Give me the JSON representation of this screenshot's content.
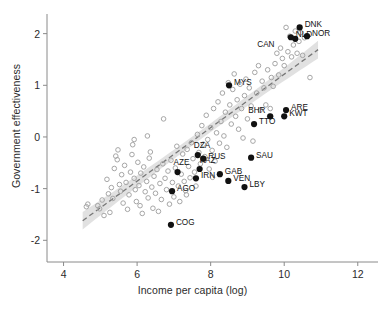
{
  "chart_data": {
    "type": "scatter",
    "title": "",
    "xlabel": "Income per capita (log)",
    "ylabel": "Government effectiveness",
    "xlim": [
      3.55,
      12.55
    ],
    "ylim": [
      -2.42,
      2.38
    ],
    "xticks": [
      4,
      6,
      8,
      10,
      12
    ],
    "xtick_labels": [
      "4",
      "6",
      "8",
      "10",
      "12"
    ],
    "yticks": [
      2,
      1,
      0,
      -1,
      -2
    ],
    "ytick_labels": [
      "2",
      "1",
      "0",
      "-1",
      "-2"
    ],
    "grid": false,
    "legend": "none",
    "fit_line": {
      "style": "dashed",
      "color": "#777777",
      "x_start": 4.52,
      "x_end": 10.92,
      "y_start": -1.62,
      "y_end": 1.69,
      "band": "95% confidence interval",
      "band_color": "#cfcfcf"
    },
    "series": [
      {
        "name": "other countries",
        "marker": "open-circle",
        "color": "#a6a6a6",
        "points": [
          [
            4.62,
            -1.35
          ],
          [
            4.66,
            -1.3
          ],
          [
            4.93,
            -1.33
          ],
          [
            4.98,
            -1.39
          ],
          [
            5.05,
            -1.22
          ],
          [
            5.1,
            -1.52
          ],
          [
            5.18,
            -0.82
          ],
          [
            5.22,
            -1.1
          ],
          [
            5.26,
            -1.46
          ],
          [
            5.3,
            -0.98
          ],
          [
            5.34,
            -1.19
          ],
          [
            5.38,
            -0.61
          ],
          [
            5.42,
            -0.37
          ],
          [
            5.46,
            -0.44
          ],
          [
            5.48,
            -0.25
          ],
          [
            5.52,
            -0.92
          ],
          [
            5.55,
            -1.05
          ],
          [
            5.58,
            -0.73
          ],
          [
            5.62,
            -1.28
          ],
          [
            5.66,
            -0.55
          ],
          [
            5.7,
            -0.88
          ],
          [
            5.74,
            -1.4
          ],
          [
            5.78,
            -1.12
          ],
          [
            5.82,
            -0.68
          ],
          [
            5.86,
            -0.34
          ],
          [
            5.88,
            -0.15
          ],
          [
            5.92,
            -0.8
          ],
          [
            5.95,
            -1.02
          ],
          [
            5.98,
            -1.25
          ],
          [
            6.02,
            -0.49
          ],
          [
            6.05,
            -0.94
          ],
          [
            6.08,
            -1.33
          ],
          [
            6.1,
            -0.7
          ],
          [
            6.14,
            -1.48
          ],
          [
            6.18,
            -0.58
          ],
          [
            6.22,
            -1.06
          ],
          [
            6.26,
            -0.86
          ],
          [
            6.3,
            -1.18
          ],
          [
            6.33,
            -0.41
          ],
          [
            6.36,
            -0.29
          ],
          [
            6.4,
            -0.97
          ],
          [
            6.43,
            -1.38
          ],
          [
            6.46,
            -0.76
          ],
          [
            6.5,
            -1.09
          ],
          [
            6.54,
            -0.63
          ],
          [
            6.58,
            -1.44
          ],
          [
            6.62,
            -0.9
          ],
          [
            6.66,
            -1.21
          ],
          [
            6.7,
            -0.52
          ],
          [
            6.72,
            0.35
          ],
          [
            6.76,
            -0.8
          ],
          [
            6.8,
            -1.02
          ],
          [
            6.84,
            -0.66
          ],
          [
            6.88,
            -1.3
          ],
          [
            6.92,
            -0.45
          ],
          [
            6.96,
            -0.88
          ],
          [
            7.0,
            -1.16
          ],
          [
            7.04,
            -0.6
          ],
          [
            7.08,
            -0.18
          ],
          [
            7.12,
            -0.95
          ],
          [
            7.16,
            -1.25
          ],
          [
            7.2,
            -0.72
          ],
          [
            7.24,
            -0.33
          ],
          [
            7.28,
            -0.86
          ],
          [
            7.32,
            -1.04
          ],
          [
            7.36,
            -0.24
          ],
          [
            7.4,
            -0.57
          ],
          [
            7.44,
            -0.79
          ],
          [
            7.48,
            -0.11
          ],
          [
            7.52,
            -0.42
          ],
          [
            7.56,
            -0.68
          ],
          [
            7.6,
            -0.95
          ],
          [
            7.64,
            0.05
          ],
          [
            7.68,
            -0.3
          ],
          [
            7.72,
            -0.52
          ],
          [
            7.76,
            0.22
          ],
          [
            7.8,
            -0.14
          ],
          [
            7.84,
            -0.38
          ],
          [
            7.88,
            0.42
          ],
          [
            7.92,
            -0.05
          ],
          [
            7.96,
            -0.62
          ],
          [
            8.0,
            0.18
          ],
          [
            8.04,
            -0.26
          ],
          [
            8.08,
            0.55
          ],
          [
            8.12,
            -0.47
          ],
          [
            8.16,
            0.08
          ],
          [
            8.2,
            0.68
          ],
          [
            8.24,
            -0.12
          ],
          [
            8.28,
            0.3
          ],
          [
            8.32,
            0.85
          ],
          [
            8.36,
            0.02
          ],
          [
            8.4,
            0.48
          ],
          [
            8.44,
            -0.2
          ],
          [
            8.48,
            1.05
          ],
          [
            8.52,
            0.62
          ],
          [
            8.56,
            0.25
          ],
          [
            8.6,
            0.92
          ],
          [
            8.64,
            1.22
          ],
          [
            8.68,
            0.4
          ],
          [
            8.72,
            0.72
          ],
          [
            8.76,
            0.15
          ],
          [
            8.8,
            1.02
          ],
          [
            8.84,
            0.55
          ],
          [
            8.88,
            -0.02
          ],
          [
            8.92,
            0.8
          ],
          [
            8.96,
            1.12
          ],
          [
            9.0,
            0.35
          ],
          [
            9.05,
            0.95
          ],
          [
            9.1,
            0.6
          ],
          [
            9.15,
            -0.08
          ],
          [
            9.2,
            1.25
          ],
          [
            9.25,
            0.85
          ],
          [
            9.3,
            1.38
          ],
          [
            9.35,
            0.52
          ],
          [
            9.4,
            1.08
          ],
          [
            9.45,
            0.95
          ],
          [
            9.5,
            0.62
          ],
          [
            9.55,
            1.3
          ],
          [
            9.6,
            0.4
          ],
          [
            9.65,
            1.15
          ],
          [
            9.7,
            0.98
          ],
          [
            9.75,
            1.42
          ],
          [
            9.8,
            1.62
          ],
          [
            9.85,
            1.2
          ],
          [
            9.9,
            1.72
          ],
          [
            9.95,
            1.52
          ],
          [
            10.0,
            1.38
          ],
          [
            10.05,
            2.12
          ],
          [
            10.1,
            1.65
          ],
          [
            10.15,
            1.95
          ],
          [
            10.2,
            1.55
          ],
          [
            10.25,
            1.78
          ],
          [
            10.3,
            2.05
          ],
          [
            10.35,
            1.62
          ],
          [
            10.4,
            1.85
          ],
          [
            10.45,
            2.02
          ],
          [
            10.5,
            1.58
          ],
          [
            10.55,
            1.92
          ],
          [
            10.6,
            1.95
          ],
          [
            10.7,
            1.15
          ],
          [
            9.62,
            0.55
          ],
          [
            8.05,
            -0.78
          ],
          [
            7.34,
            -1.12
          ],
          [
            6.28,
            0.02
          ],
          [
            5.92,
            -0.05
          ]
        ]
      },
      {
        "name": "resource-rich / highlighted countries",
        "marker": "filled-circle",
        "color": "#111111",
        "points": [
          {
            "code": "DNK",
            "x": 10.42,
            "y": 2.12,
            "label_dx": 5,
            "label_dy": -4
          },
          {
            "code": "NOR",
            "x": 10.62,
            "y": 1.95,
            "label_dx": 5,
            "label_dy": -4
          },
          {
            "code": "NLD",
            "x": 10.18,
            "y": 1.93,
            "label_dx": 5,
            "label_dy": -4
          },
          {
            "code": "CAN",
            "x": 10.3,
            "y": 1.9,
            "label_dx": -38,
            "label_dy": 4
          },
          {
            "code": "MYS",
            "x": 8.5,
            "y": 1.0,
            "label_dx": 5,
            "label_dy": -4
          },
          {
            "code": "ARE",
            "x": 10.05,
            "y": 0.52,
            "label_dx": 5,
            "label_dy": -4
          },
          {
            "code": "BHR",
            "x": 9.62,
            "y": 0.4,
            "label_dx": -22,
            "label_dy": -7
          },
          {
            "code": "KWT",
            "x": 10.0,
            "y": 0.4,
            "label_dx": 5,
            "label_dy": -4
          },
          {
            "code": "TTO",
            "x": 9.18,
            "y": 0.25,
            "label_dx": 5,
            "label_dy": -4
          },
          {
            "code": "DZA",
            "x": 7.65,
            "y": -0.35,
            "label_dx": -4,
            "label_dy": -11
          },
          {
            "code": "SAU",
            "x": 9.1,
            "y": -0.4,
            "label_dx": 5,
            "label_dy": -4
          },
          {
            "code": "RUS",
            "x": 7.8,
            "y": -0.42,
            "label_dx": 5,
            "label_dy": -4
          },
          {
            "code": "KAZ",
            "x": 7.7,
            "y": -0.62,
            "label_dx": 0,
            "label_dy": -10
          },
          {
            "code": "AZE",
            "x": 7.1,
            "y": -0.68,
            "label_dx": -4,
            "label_dy": -11
          },
          {
            "code": "GAB",
            "x": 8.25,
            "y": -0.72,
            "label_dx": 5,
            "label_dy": -4
          },
          {
            "code": "IRN",
            "x": 7.6,
            "y": -0.8,
            "label_dx": 5,
            "label_dy": -4
          },
          {
            "code": "VEN",
            "x": 8.48,
            "y": -0.85,
            "label_dx": 5,
            "label_dy": -4
          },
          {
            "code": "LBY",
            "x": 8.92,
            "y": -0.97,
            "label_dx": 5,
            "label_dy": -4
          },
          {
            "code": "AGO",
            "x": 6.95,
            "y": -1.05,
            "label_dx": 5,
            "label_dy": -4
          },
          {
            "code": "COG",
            "x": 6.92,
            "y": -1.7,
            "label_dx": 5,
            "label_dy": -4
          }
        ]
      }
    ]
  },
  "axes": {
    "x_axis_name": "Income per capita (log)",
    "y_axis_name": "Government effectiveness"
  },
  "caption": {
    "text": ""
  }
}
